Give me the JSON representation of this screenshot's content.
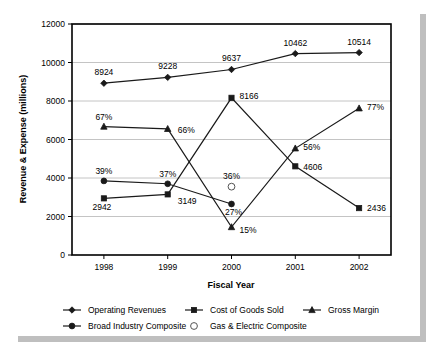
{
  "chart_data": {
    "type": "line",
    "title": "",
    "xlabel": "Fiscal Year",
    "ylabel": "Revenue & Expense (millions)",
    "categories": [
      "1998",
      "1999",
      "2000",
      "2001",
      "2002"
    ],
    "ylim": [
      0,
      12000
    ],
    "ytick_labels": [
      "0",
      "2000",
      "4000",
      "6000",
      "8000",
      "10000",
      "12000"
    ],
    "ytick_values": [
      0,
      2000,
      4000,
      6000,
      8000,
      10000,
      12000
    ],
    "grid": true,
    "legend_position": "bottom",
    "series": [
      {
        "name": "Operating Revenues",
        "marker": "diamond-filled",
        "values": [
          8924,
          9228,
          9637,
          10462,
          10514
        ],
        "point_labels": [
          "8924",
          "9228",
          "9637",
          "10462",
          "10514"
        ]
      },
      {
        "name": "Cost of Goods Sold",
        "marker": "square-filled",
        "values": [
          2942,
          3149,
          8166,
          4606,
          2436
        ],
        "point_labels": [
          "2942",
          "3149",
          "8166",
          "4606",
          "2436"
        ]
      },
      {
        "name": "Gross Margin",
        "marker": "triangle-filled",
        "values": [
          6670,
          6550,
          1450,
          5540,
          7620
        ],
        "point_labels": [
          "67%",
          "66%",
          "15%",
          "56%",
          "77%"
        ]
      },
      {
        "name": "Broad Industry Composite",
        "marker": "circle-filled",
        "values": [
          3850,
          3700,
          2650,
          null,
          null
        ],
        "point_labels": [
          "39%",
          "37%",
          "27%",
          "",
          ""
        ]
      },
      {
        "name": "Gas & Electric Composite",
        "marker": "circle-hollow",
        "values": [
          null,
          null,
          3550,
          null,
          null
        ],
        "point_labels": [
          "",
          "",
          "36%",
          "",
          ""
        ]
      }
    ]
  },
  "legend": {
    "items": [
      {
        "label": "Operating Revenues",
        "marker": "diamond-filled",
        "has_line": true
      },
      {
        "label": "Cost of Goods Sold",
        "marker": "square-filled",
        "has_line": true
      },
      {
        "label": "Gross Margin",
        "marker": "triangle-filled",
        "has_line": true
      },
      {
        "label": "Broad Industry Composite",
        "marker": "circle-filled",
        "has_line": true
      },
      {
        "label": "Gas & Electric Composite",
        "marker": "circle-hollow",
        "has_line": false
      }
    ]
  },
  "colors": {
    "series_stroke": "#1a1a1a",
    "gridline": "#b5b5b5",
    "axis": "#000000",
    "background": "#ffffff",
    "shadow": "#bfbfbf"
  }
}
